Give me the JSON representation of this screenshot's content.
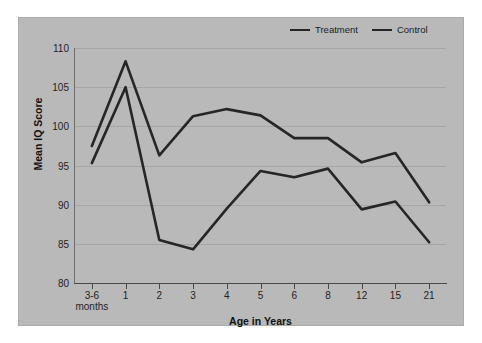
{
  "chart_data": {
    "type": "line",
    "title": "",
    "xlabel": "Age in Years",
    "ylabel": "Mean IQ Score",
    "categories": [
      "3-6 months",
      "1",
      "2",
      "3",
      "4",
      "5",
      "6",
      "8",
      "12",
      "15",
      "21"
    ],
    "category_sublabels": [
      "months",
      "",
      "",
      "",
      "",
      "",
      "",
      "",
      "",
      "",
      ""
    ],
    "ylim": [
      80,
      110
    ],
    "yticks": [
      80,
      85,
      90,
      95,
      100,
      105,
      110
    ],
    "grid": true,
    "legend_position": "top-right",
    "series": [
      {
        "name": "Treatment",
        "color": "#262626",
        "values": [
          97.5,
          108.3,
          96.3,
          101.3,
          102.2,
          101.4,
          98.5,
          98.5,
          95.4,
          96.6,
          90.3
        ]
      },
      {
        "name": "Control",
        "color": "#262626",
        "values": [
          95.3,
          105.0,
          85.5,
          84.3,
          89.5,
          94.3,
          93.5,
          94.6,
          89.4,
          90.4,
          85.2
        ]
      }
    ]
  },
  "legend": {
    "entries": [
      {
        "label": "Treatment"
      },
      {
        "label": "Control"
      }
    ]
  },
  "axes": {
    "y_title": "Mean IQ Score",
    "x_title": "Age in Years",
    "y_tick_labels": [
      "110",
      "105",
      "100",
      "95",
      "90",
      "85",
      "80"
    ],
    "x_tick_labels": [
      "3-6",
      "1",
      "2",
      "3",
      "4",
      "5",
      "6",
      "8",
      "12",
      "15",
      "21"
    ],
    "x_tick_sublabel_first": "months"
  },
  "colors": {
    "panel_background": "#b9b9b9",
    "page_background": "#ffffff",
    "line": "#262626",
    "gridline": "#a6a6a6",
    "axis": "#4a4a4a",
    "text": "#1f1f1f"
  }
}
